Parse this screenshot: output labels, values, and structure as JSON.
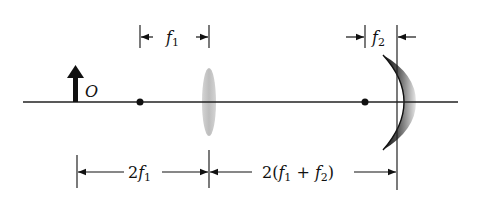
{
  "diagram": {
    "type": "optics-ray-setup",
    "object": {
      "label": "O"
    },
    "lens": {
      "focal_label_var": "f",
      "focal_label_sub": "1"
    },
    "mirror": {
      "focal_label_var": "f",
      "focal_label_sub": "2"
    },
    "dimensions": {
      "object_to_lens": {
        "coef": "2",
        "var": "f",
        "sub": "1"
      },
      "lens_to_mirror": {
        "prefix": "2(",
        "var1": "f",
        "sub1": "1",
        "plus": " + ",
        "var2": "f",
        "sub2": "2",
        "suffix": ")"
      }
    },
    "colors": {
      "axis": "#222222",
      "lens": "#c8c8c8",
      "mirror_dark": "#1a1a1a",
      "mirror_light": "#bbbbbb"
    }
  }
}
